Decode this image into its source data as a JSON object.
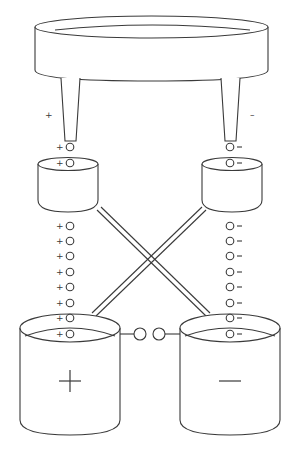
{
  "diagram": {
    "type": "electrochemical-cell-schematic",
    "labels": {
      "left_dropper_sign": "+",
      "right_dropper_sign": "–",
      "left_beaker_sign": "+",
      "right_beaker_sign": "—"
    },
    "left_ion_column": {
      "sign": "+",
      "above_small_cup_count": 2,
      "below_small_cup_count": 8
    },
    "right_ion_column": {
      "sign": "–",
      "above_small_cup_count": 2,
      "below_small_cup_count": 8
    },
    "salt_bridge_ions": 2,
    "colors": {
      "stroke": "#3a3a3a",
      "background": "#ffffff"
    }
  }
}
